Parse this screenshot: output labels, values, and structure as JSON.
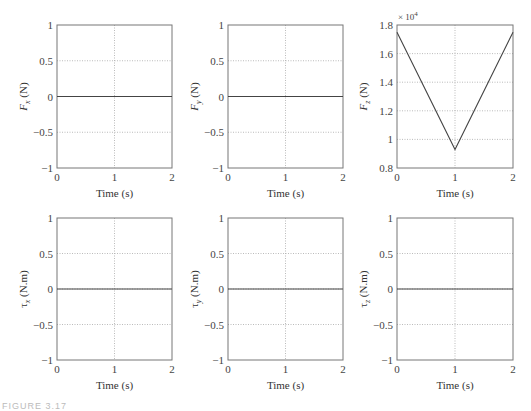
{
  "figure": {
    "caption": "FIGURE 3.17"
  },
  "chart_data": [
    {
      "type": "line",
      "title": "",
      "xlabel": "Time (s)",
      "ylabel": "Fx (N)",
      "ylabel_main": "F",
      "ylabel_sub": "x",
      "ylabel_unit": " (N)",
      "xlim": [
        0,
        2
      ],
      "ylim": [
        -1,
        1
      ],
      "xticks": [
        "0",
        "1",
        "2"
      ],
      "yticks": [
        "1",
        "0.5",
        "0",
        "−0.5",
        "−1"
      ],
      "grid": true,
      "x": [
        0,
        1,
        2
      ],
      "values": [
        0,
        0,
        0
      ]
    },
    {
      "type": "line",
      "title": "",
      "xlabel": "Time (s)",
      "ylabel": "Fy (N)",
      "ylabel_main": "F",
      "ylabel_sub": "y",
      "ylabel_unit": " (N)",
      "xlim": [
        0,
        2
      ],
      "ylim": [
        -1,
        1
      ],
      "xticks": [
        "0",
        "1",
        "2"
      ],
      "yticks": [
        "1",
        "0.5",
        "0",
        "−0.5",
        "−1"
      ],
      "grid": true,
      "x": [
        0,
        1,
        2
      ],
      "values": [
        0,
        0,
        0
      ]
    },
    {
      "type": "line",
      "title": "",
      "xlabel": "Time (s)",
      "ylabel": "Fz (N)",
      "ylabel_main": "F",
      "ylabel_sub": "z",
      "ylabel_unit": " (N)",
      "multiplier": "× 10",
      "multiplier_exp": "4",
      "xlim": [
        0,
        2
      ],
      "ylim": [
        0.8,
        1.8
      ],
      "xticks": [
        "0",
        "1",
        "2"
      ],
      "yticks": [
        "1.8",
        "1.6",
        "1.4",
        "1.2",
        "1",
        "0.8"
      ],
      "grid": true,
      "x": [
        0,
        1,
        2
      ],
      "values": [
        1.75,
        0.93,
        1.75
      ]
    },
    {
      "type": "line",
      "title": "",
      "xlabel": "Time (s)",
      "ylabel": "τx (N.m)",
      "ylabel_main": "τ",
      "ylabel_sub": "x",
      "ylabel_unit": " (N.m)",
      "xlim": [
        0,
        2
      ],
      "ylim": [
        -1,
        1
      ],
      "xticks": [
        "0",
        "1",
        "2"
      ],
      "yticks": [
        "1",
        "0.5",
        "0",
        "−0.5",
        "−1"
      ],
      "grid": true,
      "x": [
        0,
        1,
        2
      ],
      "values": [
        0,
        0,
        0
      ]
    },
    {
      "type": "line",
      "title": "",
      "xlabel": "Time (s)",
      "ylabel": "τy (N.m)",
      "ylabel_main": "τ",
      "ylabel_sub": "y",
      "ylabel_unit": " (N.m)",
      "xlim": [
        0,
        2
      ],
      "ylim": [
        -1,
        1
      ],
      "xticks": [
        "0",
        "1",
        "2"
      ],
      "yticks": [
        "1",
        "0.5",
        "0",
        "−0.5",
        "−1"
      ],
      "grid": true,
      "x": [
        0,
        1,
        2
      ],
      "values": [
        0,
        0,
        0
      ]
    },
    {
      "type": "line",
      "title": "",
      "xlabel": "Time (s)",
      "ylabel": "τz (N.m)",
      "ylabel_main": "τ",
      "ylabel_sub": "z",
      "ylabel_unit": " (N.m)",
      "xlim": [
        0,
        2
      ],
      "ylim": [
        -1,
        1
      ],
      "xticks": [
        "0",
        "1",
        "2"
      ],
      "yticks": [
        "1",
        "0.5",
        "0",
        "−0.5",
        "−1"
      ],
      "grid": true,
      "x": [
        0,
        1,
        2
      ],
      "values": [
        0,
        0,
        0
      ]
    }
  ]
}
